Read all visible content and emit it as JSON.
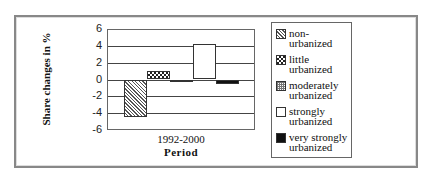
{
  "chart_data": {
    "type": "bar",
    "title": "",
    "xlabel": "Period",
    "ylabel": "Share changes in %",
    "categories": [
      "1992-2000"
    ],
    "series": [
      {
        "name": "non-urbanized",
        "values": [
          -4.5
        ],
        "pattern": "diagonal-hatch"
      },
      {
        "name": "little urbanized",
        "values": [
          1.0
        ],
        "pattern": "checkerboard"
      },
      {
        "name": "moderately urbanized",
        "values": [
          -0.1
        ],
        "pattern": "grid"
      },
      {
        "name": "strongly urbanized",
        "values": [
          4.2
        ],
        "pattern": "light-dots"
      },
      {
        "name": "very strongly urbanized",
        "values": [
          -0.5
        ],
        "pattern": "solid-black"
      }
    ],
    "ylim": [
      -6,
      6
    ],
    "yticks": [
      6,
      4,
      2,
      0,
      -2,
      -4,
      -6
    ],
    "grid": true,
    "legend_position": "right"
  },
  "axis": {
    "ylabel": "Share changes in %",
    "xlabel": "Period",
    "category": "1992-2000",
    "ticks": [
      "6",
      "4",
      "2",
      "0",
      "-2",
      "-4",
      "-6"
    ]
  },
  "legend": {
    "items": [
      {
        "line1": "non-",
        "line2": "urbanized"
      },
      {
        "line1": "little",
        "line2": "urbanized"
      },
      {
        "line1": "moderately",
        "line2": "urbanized"
      },
      {
        "line1": "strongly",
        "line2": "urbanized"
      },
      {
        "line1": "very strongly",
        "line2": "urbanized"
      }
    ]
  }
}
